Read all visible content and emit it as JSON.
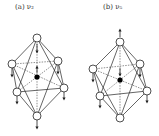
{
  "figure": {
    "panels": [
      {
        "id": "a",
        "label": "(a)  ν₂",
        "center": {
          "x": 37,
          "y": 77
        },
        "nodes": [
          {
            "name": "top",
            "x": 37,
            "y": 38,
            "arrow": "down-inside"
          },
          {
            "name": "upper-left",
            "x": 12,
            "y": 64,
            "arrow": "down"
          },
          {
            "name": "upper-right",
            "x": 58,
            "y": 61,
            "arrow": "down"
          },
          {
            "name": "lower-left",
            "x": 17,
            "y": 92,
            "arrow": "down"
          },
          {
            "name": "lower-right",
            "x": 64,
            "y": 88,
            "arrow": "down"
          },
          {
            "name": "bottom",
            "x": 37,
            "y": 116,
            "arrow": "down"
          }
        ],
        "center_arrow": "up"
      },
      {
        "id": "b",
        "label": "(b)  ν₅",
        "center": {
          "x": 41,
          "y": 80
        },
        "nodes": [
          {
            "name": "top",
            "x": 41,
            "y": 42,
            "arrow": "up"
          },
          {
            "name": "upper-left",
            "x": 14,
            "y": 69,
            "arrow": "down"
          },
          {
            "name": "upper-right",
            "x": 61,
            "y": 64,
            "arrow": "down"
          },
          {
            "name": "lower-left",
            "x": 21,
            "y": 96,
            "arrow": "down"
          },
          {
            "name": "lower-right",
            "x": 68,
            "y": 91,
            "arrow": "down"
          },
          {
            "name": "bottom",
            "x": 41,
            "y": 118,
            "arrow": "none"
          }
        ],
        "center_arrow": "down"
      }
    ],
    "colors": {
      "line": "#222222",
      "node_fill": "#ffffff",
      "center_fill": "#000000"
    }
  }
}
